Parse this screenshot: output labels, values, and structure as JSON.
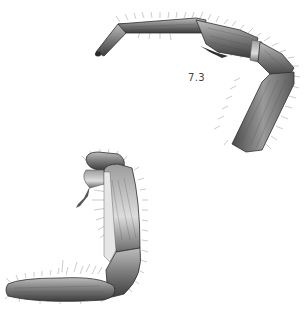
{
  "figure": {
    "label": "7.3",
    "colors": {
      "background": "#ffffff",
      "segment_fill": "#8a8a8a",
      "segment_dark": "#3a3a3a",
      "segment_light": "#cfcfcf",
      "setae": "#555555",
      "label_text": "#444444"
    },
    "illustrations": [
      {
        "name": "upper-leg",
        "segments": [
          "tarsus",
          "tibia",
          "femur-joint",
          "femur"
        ]
      },
      {
        "name": "lower-leg",
        "segments": [
          "femur",
          "tibia",
          "tarsus"
        ]
      }
    ]
  }
}
